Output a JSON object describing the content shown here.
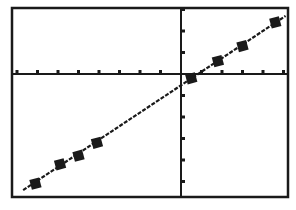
{
  "chart_data": {
    "type": "scatter",
    "title": "",
    "xlabel": "",
    "ylabel": "",
    "xlim": [
      -8,
      5.2
    ],
    "ylim": [
      -5.7,
      3.1
    ],
    "x_tick_step": 1,
    "y_tick_step": 1,
    "grid": false,
    "legend": [],
    "series": [
      {
        "name": "data points",
        "marker": "filled-square",
        "x": [
          -7.1,
          -5.9,
          -5.0,
          -4.1,
          0.5,
          1.8,
          3.0,
          4.6
        ],
        "y": [
          -5.1,
          -4.2,
          -3.8,
          -3.2,
          -0.2,
          0.6,
          1.3,
          2.4
        ]
      },
      {
        "name": "regression line",
        "style": "dotted-pixel-line",
        "x": [
          -7.7,
          5.1
        ],
        "y": [
          -5.4,
          2.7
        ]
      }
    ]
  },
  "frame": {
    "left": 12,
    "top": 8,
    "right": 288,
    "bottom": 197,
    "origin_px": [
      181,
      74
    ],
    "px_per_x": 20.5,
    "px_per_y": 21.5,
    "color": "#1a1a1a"
  }
}
